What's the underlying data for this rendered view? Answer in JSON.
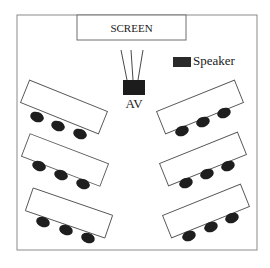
{
  "diagram": {
    "type": "room-layout",
    "room": {
      "x": 17,
      "y": 15,
      "width": 240,
      "height": 235
    },
    "screen": {
      "label": "SCREEN",
      "box": {
        "x": 77,
        "y": 15,
        "width": 109,
        "height": 25
      }
    },
    "av_unit": {
      "label": "AV",
      "box": {
        "x": 123,
        "y": 80,
        "width": 22,
        "height": 15
      },
      "label_pos": {
        "x": 134,
        "y": 108
      },
      "cables": [
        {
          "x1": 121,
          "y1": 50,
          "x2": 127,
          "y2": 80
        },
        {
          "x1": 131,
          "y1": 50,
          "x2": 133,
          "y2": 80
        },
        {
          "x1": 143,
          "y1": 50,
          "x2": 138,
          "y2": 80
        }
      ]
    },
    "speaker": {
      "label": "Speaker",
      "box": {
        "x": 173,
        "y": 57,
        "width": 18,
        "height": 10
      },
      "label_pos": {
        "x": 193,
        "y": 65
      }
    },
    "tables": [
      {
        "side": "left",
        "cx": 64,
        "cy": 107,
        "width": 84,
        "height": 24,
        "angle": 22,
        "chairs": [
          {
            "cx": 37,
            "cy": 117
          },
          {
            "cx": 58,
            "cy": 126
          },
          {
            "cx": 80,
            "cy": 134
          }
        ]
      },
      {
        "side": "left",
        "cx": 65,
        "cy": 160,
        "width": 84,
        "height": 24,
        "angle": 21,
        "chairs": [
          {
            "cx": 39,
            "cy": 166
          },
          {
            "cx": 61,
            "cy": 175
          },
          {
            "cx": 83,
            "cy": 184
          }
        ]
      },
      {
        "side": "left",
        "cx": 69,
        "cy": 213,
        "width": 84,
        "height": 24,
        "angle": 19,
        "chairs": [
          {
            "cx": 43,
            "cy": 222
          },
          {
            "cx": 66,
            "cy": 230
          },
          {
            "cx": 88,
            "cy": 238
          }
        ]
      },
      {
        "side": "right",
        "cx": 200,
        "cy": 107,
        "width": 84,
        "height": 24,
        "angle": -22,
        "chairs": [
          {
            "cx": 182,
            "cy": 131
          },
          {
            "cx": 203,
            "cy": 122
          },
          {
            "cx": 224,
            "cy": 113
          }
        ]
      },
      {
        "side": "right",
        "cx": 203,
        "cy": 159,
        "width": 84,
        "height": 24,
        "angle": -22,
        "chairs": [
          {
            "cx": 186,
            "cy": 183
          },
          {
            "cx": 207,
            "cy": 174
          },
          {
            "cx": 228,
            "cy": 166
          }
        ]
      },
      {
        "side": "right",
        "cx": 206,
        "cy": 211,
        "width": 84,
        "height": 24,
        "angle": -22,
        "chairs": [
          {
            "cx": 189,
            "cy": 236
          },
          {
            "cx": 211,
            "cy": 227
          },
          {
            "cx": 232,
            "cy": 218
          }
        ]
      }
    ],
    "chair_size": {
      "rx": 7,
      "ry": 5
    },
    "colors": {
      "outline": "#8a8a8a",
      "chair": "#1e1e1e",
      "av": "#1c1c1c",
      "speaker": "#2a2a2a",
      "text": "#1a1a1a"
    }
  }
}
